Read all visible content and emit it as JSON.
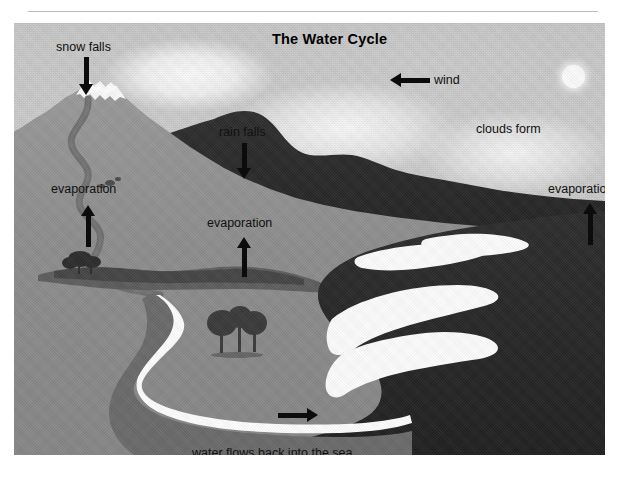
{
  "figure": {
    "title": "The Water Cycle",
    "labels": [
      {
        "id": "snow-falls",
        "text": "snow falls",
        "x": 42,
        "y": 18,
        "arrow": "down"
      },
      {
        "id": "rain-falls",
        "text": "rain falls",
        "x": 205,
        "y": 103,
        "arrow": "down"
      },
      {
        "id": "wind",
        "text": "wind",
        "x": 420,
        "y": 56,
        "arrow": "left"
      },
      {
        "id": "clouds-form",
        "text": "clouds form",
        "x": 462,
        "y": 100,
        "arrow": "none"
      },
      {
        "id": "evaporation-left",
        "text": "evaporation",
        "x": 37,
        "y": 160,
        "arrow": "up"
      },
      {
        "id": "evaporation-mid",
        "text": "evaporation",
        "x": 193,
        "y": 194,
        "arrow": "up"
      },
      {
        "id": "evaporation-right",
        "text": "evaporation",
        "x": 534,
        "y": 160,
        "arrow": "up"
      },
      {
        "id": "water-flows",
        "text": "water flows back into the sea",
        "x": 178,
        "y": 424,
        "arrow": "none"
      }
    ],
    "colors": {
      "sky": "#c6c6c6",
      "land": "#8e8e8e",
      "dark_ridge": "#2a2a2a",
      "sea": "#262626",
      "river": "#6d6d6d",
      "foam": "#fcfcfc",
      "sun": "#fbfbfb",
      "ink": "#111111",
      "page": "#ffffff",
      "rule": "#b9b9b9"
    },
    "scene_elements": [
      "snow-capped-mountain",
      "dark-ridge",
      "winding-river",
      "coastal-plain",
      "dark-sea",
      "white-surf",
      "trees-cluster",
      "shrubs",
      "sun"
    ]
  }
}
